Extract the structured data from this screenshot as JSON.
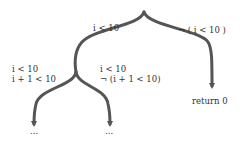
{
  "diagram": {
    "stroke_color": "#555555",
    "root": {
      "edges": [
        {
          "label": "i < 10"
        },
        {
          "label": "¬ ( i < 10 )"
        }
      ]
    },
    "left_node": {
      "edges": [
        {
          "label_lines": [
            "i < 10",
            "i + 1 < 10"
          ]
        },
        {
          "label_lines": [
            "i < 10",
            "¬ (i + 1 < 10)"
          ]
        }
      ]
    },
    "leaves": {
      "left_left": "...",
      "left_right": "...",
      "right": "return 0"
    }
  }
}
